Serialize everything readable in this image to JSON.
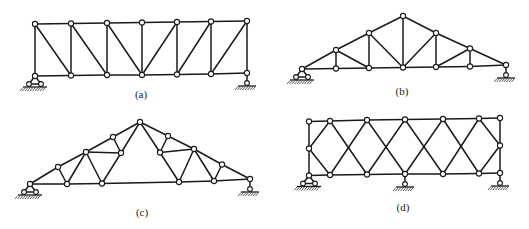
{
  "figure": {
    "background": "#ffffff",
    "line_color": "#1a1a1a",
    "panels": [
      {
        "id": "a",
        "label": "(a)",
        "label_pos": [
          141,
          98
        ],
        "description": "Parallel-chord truss with verticals and diagonals (Pratt-type), 6 panels",
        "nodes": {
          "T0": [
            35,
            24
          ],
          "T1": [
            71,
            23.5
          ],
          "T2": [
            107,
            23
          ],
          "T3": [
            142,
            22.5
          ],
          "T4": [
            177,
            22
          ],
          "T5": [
            211,
            21.5
          ],
          "T6": [
            247,
            21
          ],
          "B0": [
            35,
            76
          ],
          "B1": [
            71,
            75.5
          ],
          "B2": [
            107,
            75
          ],
          "B3": [
            142,
            75
          ],
          "B4": [
            177,
            74.5
          ],
          "B5": [
            211,
            74
          ],
          "B6": [
            247,
            73
          ]
        },
        "members": [
          [
            "T0",
            "T1"
          ],
          [
            "T1",
            "T2"
          ],
          [
            "T2",
            "T3"
          ],
          [
            "T3",
            "T4"
          ],
          [
            "T4",
            "T5"
          ],
          [
            "T5",
            "T6"
          ],
          [
            "B0",
            "B1"
          ],
          [
            "B1",
            "B2"
          ],
          [
            "B2",
            "B3"
          ],
          [
            "B3",
            "B4"
          ],
          [
            "B4",
            "B5"
          ],
          [
            "B5",
            "B6"
          ],
          [
            "T0",
            "B0"
          ],
          [
            "T1",
            "B1"
          ],
          [
            "T2",
            "B2"
          ],
          [
            "T3",
            "B3"
          ],
          [
            "T4",
            "B4"
          ],
          [
            "T5",
            "B5"
          ],
          [
            "T6",
            "B6"
          ],
          [
            "T0",
            "B1"
          ],
          [
            "T1",
            "B2"
          ],
          [
            "T2",
            "B3"
          ],
          [
            "B3",
            "T4"
          ],
          [
            "B4",
            "T5"
          ],
          [
            "B5",
            "T6"
          ]
        ],
        "supports": [
          {
            "type": "pin",
            "node": "B0"
          },
          {
            "type": "roller",
            "node": "B6"
          }
        ]
      },
      {
        "id": "b",
        "label": "(b)",
        "label_pos": [
          402,
          95
        ],
        "description": "Triangular (pitched) roof truss, 6 panels",
        "nodes": {
          "L": [
            302,
            69
          ],
          "T1": [
            336,
            50
          ],
          "T2": [
            369,
            33
          ],
          "A": [
            403,
            16
          ],
          "T4": [
            436,
            33
          ],
          "T5": [
            470,
            48.5
          ],
          "R": [
            506,
            65
          ],
          "B1": [
            336,
            68.5
          ],
          "B2": [
            369,
            68
          ],
          "B3": [
            403,
            67.5
          ],
          "B4": [
            436,
            67
          ],
          "B5": [
            470,
            66.5
          ]
        },
        "members": [
          [
            "L",
            "T1"
          ],
          [
            "T1",
            "T2"
          ],
          [
            "T2",
            "A"
          ],
          [
            "A",
            "T4"
          ],
          [
            "T4",
            "T5"
          ],
          [
            "T5",
            "R"
          ],
          [
            "L",
            "B1"
          ],
          [
            "B1",
            "B2"
          ],
          [
            "B2",
            "B3"
          ],
          [
            "B3",
            "B4"
          ],
          [
            "B4",
            "B5"
          ],
          [
            "B5",
            "R"
          ],
          [
            "T1",
            "B1"
          ],
          [
            "T2",
            "B2"
          ],
          [
            "A",
            "B3"
          ],
          [
            "T4",
            "B4"
          ],
          [
            "T5",
            "B5"
          ],
          [
            "T1",
            "B2"
          ],
          [
            "T2",
            "B3"
          ],
          [
            "B3",
            "T4"
          ],
          [
            "B4",
            "T5"
          ]
        ],
        "supports": [
          {
            "type": "pin",
            "node": "L"
          },
          {
            "type": "roller",
            "node": "R"
          }
        ]
      },
      {
        "id": "c",
        "label": "(c)",
        "label_pos": [
          142,
          216
        ],
        "description": "Fink-type (compound) roof truss with open center",
        "nodes": {
          "L": [
            30,
            184
          ],
          "P1": [
            58,
            167
          ],
          "P2": [
            86,
            152
          ],
          "P3": [
            113,
            137
          ],
          "A": [
            140,
            122
          ],
          "Q3": [
            168,
            136
          ],
          "Q2": [
            194,
            149
          ],
          "Q1": [
            222,
            164.5
          ],
          "R": [
            250,
            179
          ],
          "IL": [
            121,
            153
          ],
          "IR": [
            160,
            152.5
          ],
          "BL1": [
            67,
            184
          ],
          "BL2": [
            102,
            183.5
          ],
          "BR2": [
            179,
            182
          ],
          "BR1": [
            214,
            181
          ]
        },
        "members": [
          [
            "L",
            "P1"
          ],
          [
            "P1",
            "P2"
          ],
          [
            "P2",
            "P3"
          ],
          [
            "P3",
            "A"
          ],
          [
            "A",
            "Q3"
          ],
          [
            "Q3",
            "Q2"
          ],
          [
            "Q2",
            "Q1"
          ],
          [
            "Q1",
            "R"
          ],
          [
            "L",
            "BL1"
          ],
          [
            "BL1",
            "BL2"
          ],
          [
            "BL2",
            "BR2"
          ],
          [
            "BR2",
            "BR1"
          ],
          [
            "BR1",
            "R"
          ],
          [
            "P1",
            "BL1"
          ],
          [
            "BL1",
            "P2"
          ],
          [
            "P2",
            "BL2"
          ],
          [
            "BL2",
            "IL"
          ],
          [
            "P2",
            "IL"
          ],
          [
            "P3",
            "IL"
          ],
          [
            "IL",
            "A"
          ],
          [
            "Q1",
            "BR1"
          ],
          [
            "BR1",
            "Q2"
          ],
          [
            "Q2",
            "BR2"
          ],
          [
            "BR2",
            "IR"
          ],
          [
            "Q2",
            "IR"
          ],
          [
            "Q3",
            "IR"
          ],
          [
            "IR",
            "A"
          ]
        ],
        "supports": [
          {
            "type": "pin",
            "node": "L"
          },
          {
            "type": "roller",
            "node": "R"
          }
        ]
      },
      {
        "id": "d",
        "label": "(d)",
        "label_pos": [
          403,
          211
        ],
        "description": "Parallel-chord lattice (double-Warren / X) truss, continuous over three supports",
        "nodes": {
          "TL": [
            309,
            121.5
          ],
          "ML": [
            309,
            148.5
          ],
          "BL": [
            309,
            175.5
          ],
          "T1": [
            330,
            121
          ],
          "T2": [
            367,
            120
          ],
          "T3": [
            405,
            119.5
          ],
          "T4": [
            443,
            119
          ],
          "T5": [
            479,
            118.5
          ],
          "TR": [
            500,
            118
          ],
          "B1": [
            330,
            175
          ],
          "B2": [
            367,
            174.5
          ],
          "B3": [
            405,
            174
          ],
          "B4": [
            443,
            174
          ],
          "B5": [
            479,
            173.5
          ],
          "BR": [
            500,
            173
          ],
          "MR": [
            500,
            145.5
          ]
        },
        "members": [
          [
            "TL",
            "T1"
          ],
          [
            "T1",
            "T2"
          ],
          [
            "T2",
            "T3"
          ],
          [
            "T3",
            "T4"
          ],
          [
            "T4",
            "T5"
          ],
          [
            "T5",
            "TR"
          ],
          [
            "BL",
            "B1"
          ],
          [
            "B1",
            "B2"
          ],
          [
            "B2",
            "B3"
          ],
          [
            "B3",
            "B4"
          ],
          [
            "B4",
            "B5"
          ],
          [
            "B5",
            "BR"
          ],
          [
            "TL",
            "ML"
          ],
          [
            "ML",
            "BL"
          ],
          [
            "TR",
            "MR"
          ],
          [
            "MR",
            "BR"
          ],
          [
            "ML",
            "T1"
          ],
          [
            "ML",
            "B1"
          ],
          [
            "T1",
            "B2"
          ],
          [
            "B1",
            "T2"
          ],
          [
            "T2",
            "B3"
          ],
          [
            "B2",
            "T3"
          ],
          [
            "T3",
            "B4"
          ],
          [
            "B3",
            "T4"
          ],
          [
            "T4",
            "B5"
          ],
          [
            "B4",
            "T5"
          ],
          [
            "T5",
            "MR"
          ],
          [
            "B5",
            "MR"
          ]
        ],
        "supports": [
          {
            "type": "pin",
            "node": "BL"
          },
          {
            "type": "roller",
            "node": "B3"
          },
          {
            "type": "roller",
            "node": "BR"
          }
        ]
      }
    ]
  }
}
